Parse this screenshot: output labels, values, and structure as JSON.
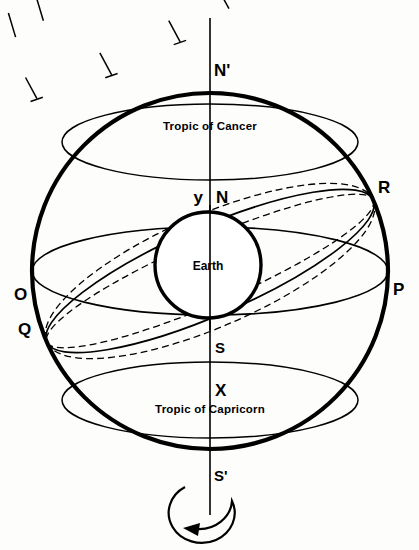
{
  "diagram": {
    "background_color": "#fdfdfc",
    "ink_color": "#000000",
    "labels": {
      "north_celestial_pole": "N'",
      "south_celestial_pole": "S'",
      "tropic_of_cancer": "Tropic of Cancer",
      "tropic_of_capricorn": "Tropic of Capricorn",
      "earth": "Earth",
      "point_N": "N",
      "point_S": "S",
      "point_X": "X",
      "point_y": "y",
      "point_O": "O",
      "point_P": "P",
      "point_Q": "Q",
      "point_R": "R"
    },
    "geometry": {
      "sphere_center_x": 210,
      "sphere_center_y": 271,
      "sphere_radius": 178,
      "earth_center_x": 208,
      "earth_center_y": 265,
      "earth_radius": 53,
      "axis_top_y": 18,
      "axis_bottom_y": 515
    },
    "rotation_arrow": {
      "name": "rotation-direction-arrow",
      "direction": "counterclockwise"
    }
  }
}
